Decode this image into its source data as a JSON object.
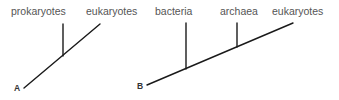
{
  "diagram": {
    "type": "phylogenetic-tree-comparison",
    "colors": {
      "line": "#1a1a1a",
      "label": "#555555",
      "panel_letter": "#333333",
      "background": "#ffffff"
    },
    "panels": [
      {
        "id": "A",
        "letter": "A",
        "taxa": [
          "prokaryotes",
          "eukaryotes"
        ]
      },
      {
        "id": "B",
        "letter": "B",
        "taxa": [
          "bacteria",
          "archaea",
          "eukaryotes"
        ]
      }
    ]
  }
}
